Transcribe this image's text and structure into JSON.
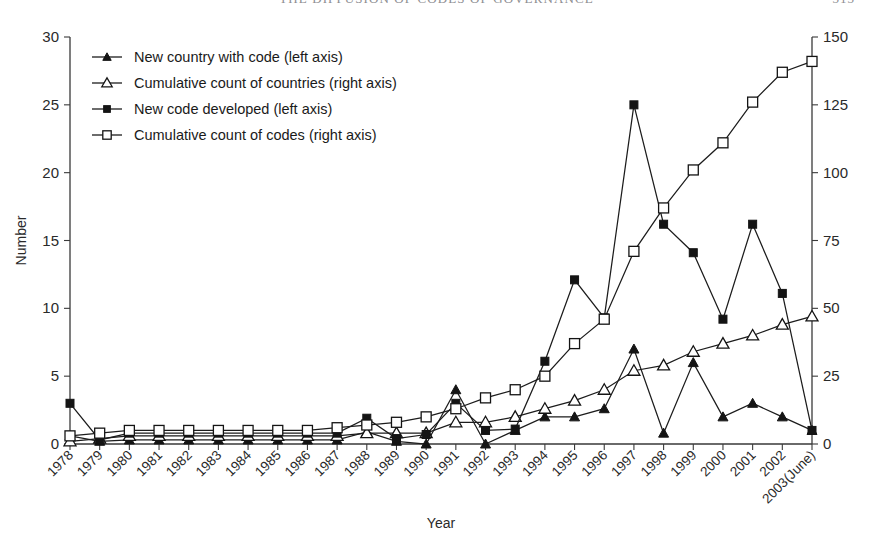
{
  "page": {
    "running_head": "THE DIFFUSION OF CODES OF GOVERNANCE",
    "folio": "313"
  },
  "chart_data": {
    "type": "line",
    "title": "",
    "xlabel": "Year",
    "ylabel": "Number",
    "y2label": "",
    "ylim": [
      0,
      30
    ],
    "y2lim": [
      0,
      150
    ],
    "yticks": [
      0,
      5,
      10,
      15,
      20,
      25,
      30
    ],
    "y2ticks": [
      0,
      25,
      50,
      75,
      100,
      125,
      150
    ],
    "grid": false,
    "legend_position": "upper-left",
    "categories": [
      "1978",
      "1979",
      "1980",
      "1981",
      "1982",
      "1983",
      "1984",
      "1985",
      "1986",
      "1987",
      "1988",
      "1989",
      "1990",
      "1991",
      "1992",
      "1993",
      "1994",
      "1995",
      "1996",
      "1997",
      "1998",
      "1999",
      "2000",
      "2001",
      "2002",
      "2003(June)"
    ],
    "series": [
      {
        "name": "New country with code (left axis)",
        "axis": "left",
        "marker": "filled-triangle",
        "values": [
          0.6,
          0.2,
          0.3,
          0.3,
          0.3,
          0.3,
          0.3,
          0.3,
          0.3,
          0.3,
          0.9,
          0.2,
          0.0,
          4.0,
          0.0,
          1.0,
          2.0,
          2.0,
          2.6,
          7.0,
          0.8,
          6.0,
          2.0,
          3.0,
          2.0,
          1.0
        ]
      },
      {
        "name": "Cumulative count of countries (right axis)",
        "axis": "right",
        "marker": "open-triangle",
        "values": [
          1,
          2,
          3,
          3,
          3,
          3,
          3,
          3,
          3,
          3,
          4,
          4,
          4,
          8,
          8,
          10,
          13,
          16,
          20,
          27,
          29,
          34,
          37,
          40,
          44,
          47
        ]
      },
      {
        "name": "New code developed (left axis)",
        "axis": "left",
        "marker": "filled-square",
        "values": [
          3.0,
          0.3,
          0.8,
          0.8,
          0.8,
          0.8,
          0.8,
          0.8,
          0.8,
          0.8,
          1.9,
          0.4,
          0.7,
          3.0,
          1.0,
          1.1,
          6.1,
          12.1,
          9.3,
          25.0,
          16.2,
          14.1,
          9.2,
          16.2,
          11.1,
          1.0
        ]
      },
      {
        "name": "Cumulative count of codes (right axis)",
        "axis": "right",
        "marker": "open-square",
        "values": [
          3,
          4,
          5,
          5,
          5,
          5,
          5,
          5,
          5,
          6,
          7,
          8,
          10,
          13,
          17,
          20,
          25,
          37,
          46,
          71,
          87,
          101,
          111,
          126,
          137,
          141
        ]
      }
    ]
  },
  "legend": {
    "entries": [
      {
        "label": "New country with code (left axis)",
        "marker": "filled-triangle"
      },
      {
        "label": "Cumulative count of countries (right axis)",
        "marker": "open-triangle"
      },
      {
        "label": "New code developed (left axis)",
        "marker": "filled-square"
      },
      {
        "label": "Cumulative count of codes (right axis)",
        "marker": "open-square"
      }
    ]
  }
}
